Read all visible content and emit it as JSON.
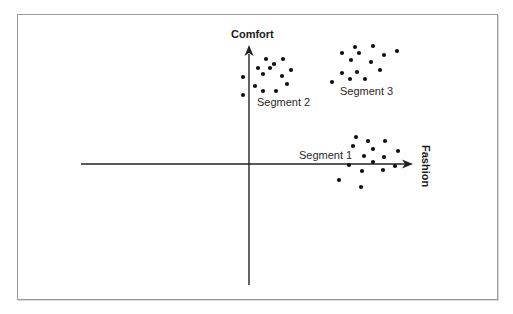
{
  "diagram": {
    "type": "perceptual-map",
    "axes": {
      "x_label": "Fashion",
      "y_label": "Comfort"
    },
    "segments": [
      {
        "label": "Segment 1",
        "points": [
          [
            356,
            137
          ],
          [
            368,
            141
          ],
          [
            385,
            141
          ],
          [
            353,
            146
          ],
          [
            373,
            149
          ],
          [
            398,
            151
          ],
          [
            364,
            156
          ],
          [
            384,
            157
          ],
          [
            349,
            165
          ],
          [
            373,
            162
          ],
          [
            395,
            166
          ],
          [
            362,
            171
          ],
          [
            383,
            170
          ],
          [
            339,
            180
          ],
          [
            361,
            187
          ]
        ]
      },
      {
        "label": "Segment 2",
        "points": [
          [
            266,
            59
          ],
          [
            283,
            59
          ],
          [
            274,
            64
          ],
          [
            258,
            68
          ],
          [
            270,
            68
          ],
          [
            291,
            70
          ],
          [
            263,
            74
          ],
          [
            282,
            76
          ],
          [
            243,
            77
          ],
          [
            287,
            84
          ],
          [
            255,
            86
          ],
          [
            263,
            91
          ],
          [
            276,
            91
          ],
          [
            243,
            95
          ]
        ]
      },
      {
        "label": "Segment 3",
        "points": [
          [
            373,
            46
          ],
          [
            355,
            47
          ],
          [
            397,
            51
          ],
          [
            342,
            53
          ],
          [
            359,
            53
          ],
          [
            384,
            55
          ],
          [
            351,
            60
          ],
          [
            371,
            62
          ],
          [
            380,
            70
          ],
          [
            357,
            72
          ],
          [
            342,
            73
          ],
          [
            365,
            79
          ],
          [
            350,
            79
          ],
          [
            332,
            82
          ]
        ]
      }
    ],
    "colors": {
      "axis": "#222222",
      "dot": "#111111",
      "frame": "#9a9a9a"
    }
  }
}
